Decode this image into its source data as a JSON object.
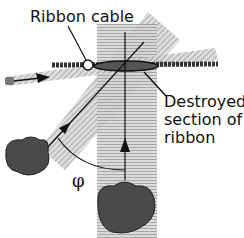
{
  "diagram": {
    "top_text_partial": "the ribbon was pulled by",
    "labels": {
      "ribbon_cable": "Ribbon cable",
      "destroyed_section": [
        "Destroyed",
        "section of",
        "ribbon"
      ],
      "angle": "φ"
    },
    "elements": [
      {
        "name": "vertical-beam",
        "description": "horizontal-striped vertical beam from lower particle"
      },
      {
        "name": "diagonal-beam",
        "description": "diagonal hatched beam from left particle"
      },
      {
        "name": "incoming-beam",
        "description": "hatched beam entering from left with arrow"
      },
      {
        "name": "ribbon-cable",
        "description": "dark horizontal cable with open circle marker"
      },
      {
        "name": "destroyed-ellipse",
        "description": "ellipse marking destroyed section"
      },
      {
        "name": "particle-left",
        "description": "dark rock-like source at left"
      },
      {
        "name": "particle-bottom",
        "description": "dark rock-like source at bottom"
      }
    ],
    "colors": {
      "beam": "#bdbdbd",
      "cable": "#333333",
      "particle": "#4a4a4a",
      "text": "#111111"
    }
  }
}
